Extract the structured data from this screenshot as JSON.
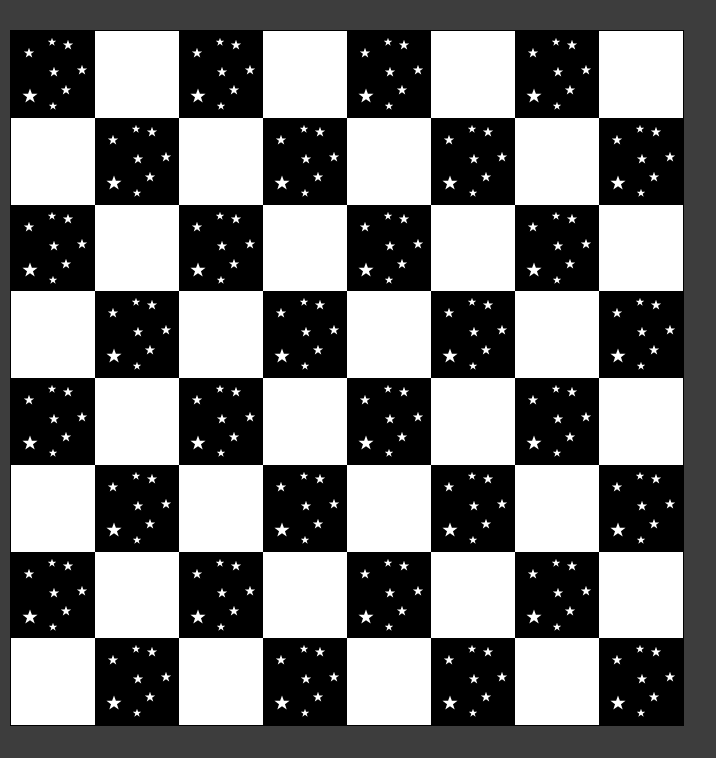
{
  "board": {
    "rows": 8,
    "cols": 8,
    "top_left_color": "dark",
    "colors": {
      "dark": "#000000",
      "light": "#ffffff",
      "star": "#ffffff",
      "background": "#3d3d3d",
      "border": "#000000"
    },
    "dark_square_pattern": "starfield",
    "stars": [
      {
        "x": 41,
        "y": 11,
        "size": 9
      },
      {
        "x": 57,
        "y": 14,
        "size": 11
      },
      {
        "x": 18,
        "y": 22,
        "size": 11
      },
      {
        "x": 43,
        "y": 41,
        "size": 11
      },
      {
        "x": 71,
        "y": 39,
        "size": 11
      },
      {
        "x": 19,
        "y": 65,
        "size": 16
      },
      {
        "x": 55,
        "y": 59,
        "size": 11
      },
      {
        "x": 42,
        "y": 75,
        "size": 9
      }
    ]
  }
}
